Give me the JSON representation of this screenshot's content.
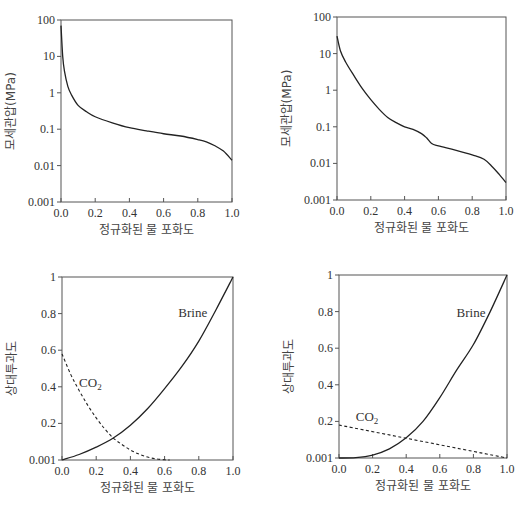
{
  "chart_data": [
    {
      "id": "top-left",
      "type": "line",
      "title": "",
      "xlabel": "정규화된 물 포화도",
      "ylabel": "모세관압(MPa)",
      "yscale": "log",
      "xlim": [
        0.0,
        1.0
      ],
      "ylim": [
        0.001,
        100
      ],
      "xticks": [
        "0.0",
        "0.2",
        "0.4",
        "0.6",
        "0.8",
        "1.0"
      ],
      "yticks": [
        "100",
        "10",
        "1",
        "0.1",
        "0.01",
        "0.001"
      ],
      "grid": false,
      "series": [
        {
          "name": "capillary-pressure",
          "style": "solid",
          "x": [
            0.0,
            0.01,
            0.02,
            0.04,
            0.06,
            0.1,
            0.15,
            0.2,
            0.3,
            0.4,
            0.5,
            0.6,
            0.7,
            0.8,
            0.85,
            0.9,
            0.95,
            1.0
          ],
          "y": [
            70,
            10,
            4,
            1.5,
            0.9,
            0.45,
            0.3,
            0.22,
            0.15,
            0.11,
            0.09,
            0.075,
            0.065,
            0.052,
            0.045,
            0.035,
            0.025,
            0.014
          ]
        }
      ]
    },
    {
      "id": "top-right",
      "type": "line",
      "title": "",
      "xlabel": "정규화된 물 포화도",
      "ylabel": "모세관압(MPa)",
      "yscale": "log",
      "xlim": [
        0.0,
        1.0
      ],
      "ylim": [
        0.001,
        100
      ],
      "xticks": [
        "0.0",
        "0.2",
        "0.4",
        "0.6",
        "0.8",
        "1.0"
      ],
      "yticks": [
        "100",
        "10",
        "1",
        "0.1",
        "0.01",
        "0.001"
      ],
      "grid": false,
      "series": [
        {
          "name": "capillary-pressure",
          "style": "solid",
          "x": [
            0.0,
            0.02,
            0.05,
            0.1,
            0.15,
            0.2,
            0.25,
            0.3,
            0.35,
            0.4,
            0.45,
            0.5,
            0.53,
            0.56,
            0.6,
            0.7,
            0.8,
            0.87,
            0.92,
            0.96,
            1.0
          ],
          "y": [
            30,
            12,
            6,
            2.5,
            1.1,
            0.55,
            0.3,
            0.18,
            0.13,
            0.1,
            0.085,
            0.065,
            0.05,
            0.035,
            0.03,
            0.023,
            0.017,
            0.013,
            0.008,
            0.005,
            0.003
          ]
        }
      ]
    },
    {
      "id": "bottom-left",
      "type": "line",
      "title": "",
      "xlabel": "정규화된 물 포화도",
      "ylabel": "상대투과도",
      "yscale": "linear",
      "xlim": [
        0.0,
        1.0
      ],
      "ylim": [
        0.0,
        1.0
      ],
      "xticks": [
        "0.0",
        "0.2",
        "0.4",
        "0.6",
        "0.8",
        "1.0"
      ],
      "yticks": [
        "1",
        "0.8",
        "0.6",
        "0.4",
        "0.2",
        "0.001"
      ],
      "grid": false,
      "series": [
        {
          "name": "Brine",
          "style": "solid",
          "x": [
            0.0,
            0.1,
            0.2,
            0.3,
            0.4,
            0.5,
            0.6,
            0.7,
            0.8,
            0.9,
            1.0
          ],
          "y": [
            0.0,
            0.03,
            0.07,
            0.12,
            0.19,
            0.28,
            0.39,
            0.51,
            0.65,
            0.82,
            1.0
          ]
        },
        {
          "name": "CO2",
          "style": "dashed",
          "x": [
            0.0,
            0.05,
            0.1,
            0.15,
            0.2,
            0.25,
            0.3,
            0.35,
            0.4,
            0.45,
            0.5,
            0.55,
            0.6,
            0.63
          ],
          "y": [
            0.58,
            0.47,
            0.38,
            0.3,
            0.23,
            0.17,
            0.12,
            0.085,
            0.055,
            0.032,
            0.016,
            0.006,
            0.001,
            0.0
          ]
        }
      ],
      "annotations": [
        {
          "text": "Brine",
          "x": 0.68,
          "y": 0.78
        },
        {
          "text": "CO₂",
          "x": 0.1,
          "y": 0.4
        }
      ]
    },
    {
      "id": "bottom-right",
      "type": "line",
      "title": "",
      "xlabel": "정규화된 물 포화도",
      "ylabel": "상대투과도",
      "yscale": "linear",
      "xlim": [
        0.0,
        1.0
      ],
      "ylim": [
        0.0,
        1.0
      ],
      "xticks": [
        "0.0",
        "0.2",
        "0.4",
        "0.6",
        "0.8",
        "1.0"
      ],
      "yticks": [
        "1",
        "0.8",
        "0.6",
        "0.4",
        "0.2",
        "0.001"
      ],
      "grid": false,
      "series": [
        {
          "name": "Brine",
          "style": "solid",
          "x": [
            0.0,
            0.1,
            0.2,
            0.3,
            0.4,
            0.5,
            0.6,
            0.7,
            0.8,
            0.9,
            1.0
          ],
          "y": [
            0.0,
            0.002,
            0.016,
            0.05,
            0.11,
            0.2,
            0.33,
            0.48,
            0.62,
            0.8,
            1.0
          ]
        },
        {
          "name": "CO2",
          "style": "dashed",
          "x": [
            0.0,
            1.0
          ],
          "y": [
            0.18,
            0.0
          ]
        }
      ],
      "annotations": [
        {
          "text": "Brine",
          "x": 0.7,
          "y": 0.77
        },
        {
          "text": "CO₂",
          "x": 0.1,
          "y": 0.2
        }
      ]
    }
  ],
  "layout": {
    "panels": [
      {
        "x0": 61,
        "x1": 232,
        "ytop": 20,
        "ybot": 202
      },
      {
        "x0": 337,
        "x1": 506,
        "ytop": 17,
        "ybot": 200
      },
      {
        "x0": 62,
        "x1": 233,
        "ytop": 277,
        "ybot": 460
      },
      {
        "x0": 339,
        "x1": 507,
        "ytop": 275,
        "ybot": 458
      }
    ]
  },
  "colors": {
    "axis": "#555555",
    "line": "#222222"
  }
}
